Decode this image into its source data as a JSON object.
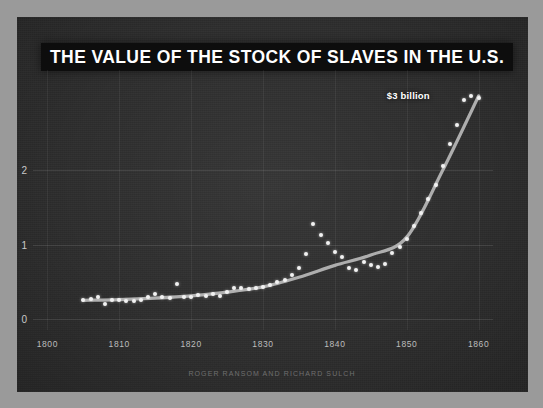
{
  "chart": {
    "title": "THE VALUE OF THE STOCK OF SLAVES IN THE U.S.",
    "credit": "ROGER RANSOM AND RICHARD SULCH",
    "annotation": "$3 billion",
    "colors": {
      "panel_background": "#2e2e2e",
      "title_background": "#0d0d0d",
      "title_text": "#ffffff",
      "point": "#f2f2f2",
      "trend_line": "#b9b9b9",
      "tick_text": "#c9c9c9",
      "credit_text": "#6f6f6f",
      "page_background": "#9a9a9a"
    }
  },
  "chart_data": {
    "type": "scatter",
    "title": "THE VALUE OF THE STOCK OF SLAVES IN THE U.S.",
    "subtitle": "",
    "xlabel": "",
    "ylabel": "",
    "unit": "billions of dollars",
    "grid": true,
    "legend": null,
    "xlim": [
      1798,
      1862
    ],
    "ylim": [
      -0.15,
      3.35
    ],
    "xticks": [
      1800,
      1810,
      1820,
      1830,
      1840,
      1850,
      1860
    ],
    "xticklabels": [
      "1800",
      "1810",
      "1820",
      "1830",
      "1840",
      "1850",
      "1860"
    ],
    "yticks": [
      0,
      1,
      2
    ],
    "yticklabels": [
      "0",
      "1",
      "2"
    ],
    "annotations": [
      {
        "text": "$3 billion",
        "x": 1855,
        "y": 3.0
      }
    ],
    "series": [
      {
        "name": "Value of stock of slaves",
        "type": "scatter",
        "x": [
          1805,
          1806,
          1807,
          1808,
          1809,
          1810,
          1811,
          1812,
          1813,
          1814,
          1815,
          1816,
          1817,
          1818,
          1819,
          1820,
          1821,
          1822,
          1823,
          1824,
          1825,
          1826,
          1827,
          1828,
          1829,
          1830,
          1831,
          1832,
          1833,
          1834,
          1835,
          1836,
          1837,
          1838,
          1839,
          1840,
          1841,
          1842,
          1843,
          1844,
          1845,
          1846,
          1847,
          1848,
          1849,
          1850,
          1851,
          1852,
          1853,
          1854,
          1855,
          1856,
          1857,
          1858,
          1859,
          1860
        ],
        "y": [
          0.26,
          0.27,
          0.29,
          0.2,
          0.25,
          0.26,
          0.24,
          0.24,
          0.25,
          0.3,
          0.33,
          0.29,
          0.28,
          0.47,
          0.29,
          0.3,
          0.32,
          0.31,
          0.33,
          0.31,
          0.36,
          0.42,
          0.41,
          0.4,
          0.41,
          0.43,
          0.46,
          0.49,
          0.52,
          0.59,
          0.69,
          0.87,
          1.28,
          1.13,
          1.02,
          0.9,
          0.83,
          0.69,
          0.66,
          0.76,
          0.73,
          0.7,
          0.74,
          0.88,
          0.97,
          1.07,
          1.25,
          1.42,
          1.62,
          1.8,
          2.06,
          2.36,
          2.61,
          2.94,
          3.0,
          2.97
        ]
      },
      {
        "name": "Smoothed trend",
        "type": "line",
        "x": [
          1805,
          1810,
          1815,
          1820,
          1825,
          1830,
          1835,
          1840,
          1845,
          1850,
          1855,
          1860
        ],
        "y": [
          0.25,
          0.26,
          0.28,
          0.31,
          0.36,
          0.43,
          0.56,
          0.72,
          0.86,
          1.1,
          2.0,
          3.0
        ]
      }
    ]
  }
}
